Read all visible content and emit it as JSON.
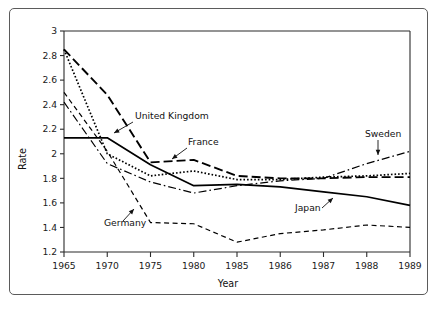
{
  "figure": {
    "border_color": "#5b5b5b",
    "background": "#ffffff",
    "ink_color": "#000000"
  },
  "chart_data": {
    "type": "line",
    "title": "",
    "xlabel": "Year",
    "ylabel": "Rate",
    "categories": [
      "1965",
      "1970",
      "1975",
      "1980",
      "1985",
      "1986",
      "1987",
      "1988",
      "1989"
    ],
    "ylim": [
      1.2,
      3.0
    ],
    "ytick_labels": [
      "1.2",
      "1.4",
      "1.6",
      "1.8",
      "2",
      "2.2",
      "2.4",
      "2.6",
      "2.8",
      "3"
    ],
    "ytick_values": [
      1.2,
      1.4,
      1.6,
      1.8,
      2.0,
      2.2,
      2.4,
      2.6,
      2.8,
      3.0
    ],
    "ytick_step": 0.2,
    "grid": false,
    "legend": "inline-annotations",
    "series": [
      {
        "name": "United Kingdom",
        "line_style": "dotted",
        "values": [
          2.85,
          2.0,
          1.82,
          1.86,
          1.79,
          1.79,
          1.81,
          1.82,
          1.84
        ]
      },
      {
        "name": "France",
        "line_style": "long-dash",
        "values": [
          2.85,
          2.48,
          1.93,
          1.95,
          1.82,
          1.8,
          1.8,
          1.81,
          1.81
        ]
      },
      {
        "name": "Japan",
        "line_style": "solid",
        "values": [
          2.13,
          2.13,
          1.91,
          1.74,
          1.75,
          1.73,
          1.69,
          1.65,
          1.58
        ]
      },
      {
        "name": "Sweden",
        "line_style": "dash-dot",
        "values": [
          2.42,
          1.92,
          1.77,
          1.68,
          1.74,
          1.78,
          1.8,
          1.92,
          2.02
        ]
      },
      {
        "name": "Germany",
        "line_style": "short-dash",
        "values": [
          2.5,
          2.02,
          1.44,
          1.43,
          1.28,
          1.35,
          1.38,
          1.42,
          1.4
        ]
      }
    ],
    "annotations": [
      {
        "text": "United Kingdom",
        "label_x": 125,
        "label_y": 110,
        "anchor": "start",
        "leader_from_x": 123,
        "leader_from_y": 113,
        "leader_to_x": 104,
        "leader_to_y": 124
      },
      {
        "text": "France",
        "label_x": 178,
        "label_y": 136,
        "anchor": "start",
        "leader_from_x": 177,
        "leader_from_y": 139,
        "leader_to_x": 162,
        "leader_to_y": 150
      },
      {
        "text": "Sweden",
        "label_x": 355,
        "label_y": 128,
        "anchor": "start",
        "leader_from_x": 368,
        "leader_from_y": 131,
        "leader_to_x": 368,
        "leader_to_y": 146
      },
      {
        "text": "Japan",
        "label_x": 285,
        "label_y": 202,
        "anchor": "start",
        "leader_from_x": 312,
        "leader_from_y": 199,
        "leader_to_x": 323,
        "leader_to_y": 189
      },
      {
        "text": "Germany",
        "label_x": 94,
        "label_y": 217,
        "anchor": "start",
        "leader_from_x": 113,
        "leader_from_y": 212,
        "leader_to_x": 124,
        "leader_to_y": 200
      }
    ]
  }
}
